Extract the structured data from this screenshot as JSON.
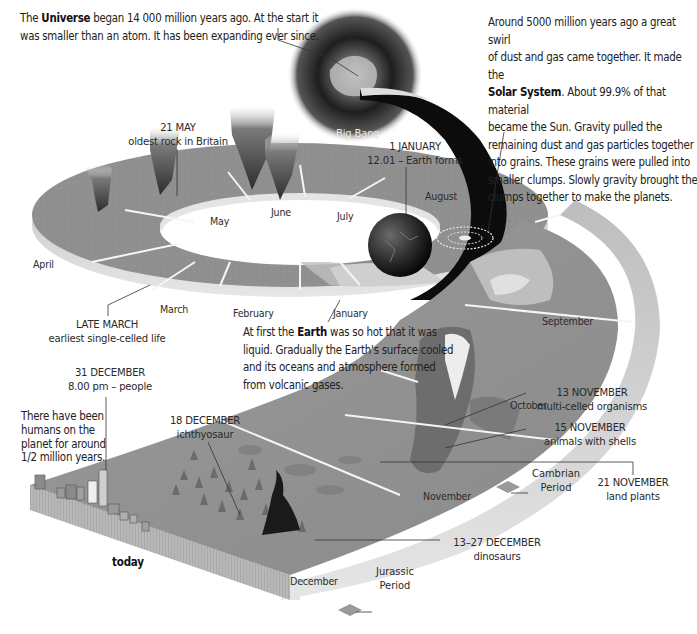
{
  "intro": {
    "universe": {
      "prefix": "The ",
      "bold": "Universe",
      "line1_rest": " began 14 000 million years ago. At the start it",
      "line2": "was smaller than an atom. It has been expanding ever since."
    },
    "solar_system": {
      "line1": "Around 5000 million years ago a great swirl",
      "line2": "of dust and gas came together. It made the",
      "bold": "Solar System",
      "line3_rest": ". About 99.9% of that material",
      "line4": "became the Sun. Gravity pulled the",
      "line5": "remaining dust and gas particles together",
      "line6": "into grains. These grains were pulled into",
      "line7": "smaller clumps. Slowly gravity brought the",
      "line8": "clumps together to make the planets."
    },
    "earth": {
      "prefix": "At first the ",
      "bold": "Earth",
      "line1_rest": " was so hot that it was",
      "line2": "liquid. Gradually the Earth's surface cooled",
      "line3": "and its oceans and atmosphere formed",
      "line4": "from volcanic gases."
    },
    "humans": {
      "line1": "There have been",
      "line2": "humans on the",
      "line3": "planet for around",
      "line4": "1/2 million years."
    }
  },
  "big_bang_label": "Big Bang",
  "events": {
    "earth_forms": {
      "date": "1 JANUARY",
      "desc": "12.01 – Earth forms"
    },
    "oldest_rock": {
      "date": "21 MAY",
      "desc": "oldest rock in Britain"
    },
    "single_celled": {
      "date": "LATE MARCH",
      "desc": "earliest single-celled life"
    },
    "people": {
      "date": "31 DECEMBER",
      "desc": "8.00 pm – people"
    },
    "ichthyosaur": {
      "date": "18 DECEMBER",
      "desc": "ichthyosaur"
    },
    "multi_celled": {
      "date": "13 NOVEMBER",
      "desc": "multi-celled organisms"
    },
    "shells": {
      "date": "15 NOVEMBER",
      "desc": "animals with shells"
    },
    "land_plants": {
      "date": "21 NOVEMBER",
      "desc": "land plants"
    },
    "dinosaurs": {
      "date": "13–27 DECEMBER",
      "desc": "dinosaurs"
    }
  },
  "periods": {
    "cambrian": {
      "line1": "Cambrian",
      "line2": "Period"
    },
    "jurassic": {
      "line1": "Jurassic",
      "line2": "Period"
    }
  },
  "months": {
    "january": "January",
    "february": "February",
    "march": "March",
    "april": "April",
    "may": "May",
    "june": "June",
    "july": "July",
    "august": "August",
    "september": "September",
    "october": "October",
    "november": "November",
    "december": "December"
  },
  "today_label": "today",
  "colors": {
    "ring_top": "#8e8e8e",
    "ring_side": "#c9c9c9",
    "tail_dark": "#0c0c0c",
    "band_light": "#d9d9d9",
    "text": "#222222"
  }
}
